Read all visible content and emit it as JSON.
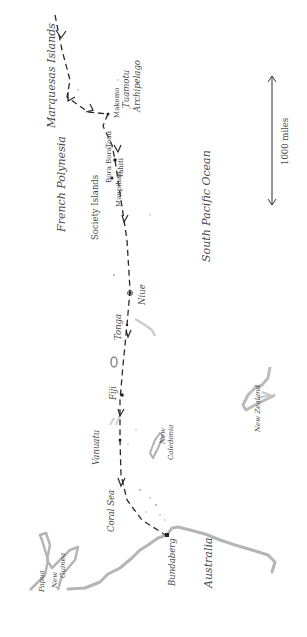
{
  "map": {
    "orientation": "rotated -90 degrees (north to the left)",
    "colors": {
      "background": "#ffffff",
      "route": "#2a2a2a",
      "land": "#b8b8b8",
      "text": "#4a4a4a"
    },
    "scale_bar": {
      "label": "1000 miles"
    },
    "regions": {
      "french_polynesia": "French Polynesia",
      "south_pacific_ocean": "South Pacific Ocean",
      "coral_sea": "Coral Sea",
      "tuamotu": "Tuamotu",
      "archipelago": "Archipelago",
      "society_islands": "Society Islands"
    },
    "places": {
      "marquesas": "Marquesas Islands",
      "makemo": "Makemo",
      "toau": "Toau",
      "bora_bora": "Bora Bora",
      "tahiti": "Tahiti",
      "maupihaa": "Maupihaa",
      "niue": "Niue",
      "tonga": "Tonga",
      "fiji": "Fiji",
      "vanuatu": "Vanuatu",
      "new_caledonia_1": "New",
      "new_caledonia_2": "Caledonia",
      "new_zealand": "New Zealand",
      "australia": "Australia",
      "bundaberg": "Bundaberg",
      "png_1": "Papua",
      "png_2": "New",
      "png_3": "Guinea"
    },
    "route_stops": [
      "Marquesas Islands",
      "Makemo",
      "Toau",
      "Tahiti",
      "Bora Bora",
      "Maupihaa",
      "Niue",
      "Tonga",
      "Fiji",
      "Vanuatu",
      "New Caledonia",
      "Bundaberg"
    ]
  }
}
